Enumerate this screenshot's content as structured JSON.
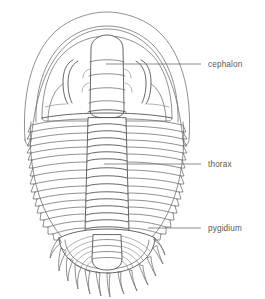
{
  "figure": {
    "background_color": "#ffffff",
    "line_color": "#6b6b6e",
    "line_color_dark": "#4a4a4d",
    "label_color": "#58585a",
    "leader_color": "#6e6e71"
  },
  "labels": [
    {
      "id": "cephalon",
      "text": "cephalon",
      "leader_x_start": 106,
      "leader_x_end": 201,
      "leader_y": 64,
      "text_x": 208,
      "text_y": 61
    },
    {
      "id": "thorax",
      "text": "thorax",
      "leader_x_start": 104,
      "leader_x_end": 201,
      "leader_y": 164,
      "text_x": 208,
      "text_y": 161
    },
    {
      "id": "pygidium",
      "text": "pygidium",
      "leader_x_start": 148,
      "leader_x_end": 201,
      "leader_y": 228,
      "text_x": 208,
      "text_y": 225
    }
  ],
  "anatomy": {
    "cephalon_label": "cephalon",
    "thorax_label": "thorax",
    "pygidium_label": "pygidium",
    "thoracic_segment_count": 17,
    "pygidial_spine_count": 13,
    "pygidial_rib_count": 9
  }
}
